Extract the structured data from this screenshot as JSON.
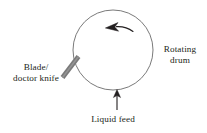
{
  "figure": {
    "type": "process-diagram",
    "background_color": "#ffffff"
  },
  "drum": {
    "name": "Rotating drum",
    "shape": "circle",
    "center_x": 113,
    "center_y": 50,
    "radius": 40,
    "stroke_color": "#6b6b6b",
    "stroke_width": 0.9,
    "fill": "none"
  },
  "rotation_arrow": {
    "name": "rotation-direction-arrow",
    "direction": "counterclockwise",
    "color": "#231f20",
    "description": "curved arrow inside top of drum pointing left"
  },
  "blade": {
    "name": "Blade / doctor knife",
    "color": "#7a7a7a",
    "stroke_width": 4.6,
    "x1": 62,
    "y1": 78,
    "x2": 79,
    "y2": 56,
    "angle_degrees": -52
  },
  "feed_arrow": {
    "name": "liquid-feed-arrow",
    "direction": "up",
    "color": "#231f20",
    "x": 117,
    "y_start": 109,
    "y_end": 90
  },
  "labels": {
    "blade": {
      "line1": "Blade/",
      "line2": "doctor knife"
    },
    "drum": {
      "line1": "Rotating",
      "line2": "drum"
    },
    "liquid_feed": {
      "line1": "Liquid feed"
    }
  },
  "colors": {
    "text": "#231f20",
    "drum_stroke": "#6b6b6b",
    "blade_fill": "#7a7a7a",
    "arrow": "#231f20"
  }
}
